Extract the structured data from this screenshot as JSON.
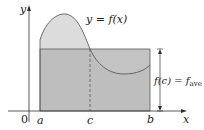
{
  "diagram": {
    "axes": {
      "x_label": "x",
      "y_label": "y",
      "origin_label": "0"
    },
    "curve_label": {
      "lhs": "y = ",
      "fn": "f",
      "arg": "(x)"
    },
    "points": {
      "a": "a",
      "c": "c",
      "b": "b"
    },
    "average_label": {
      "lhs_fn": "f",
      "lhs_arg": "(c) = ",
      "rhs_fn": "f",
      "rhs_sub": "ave"
    },
    "colors": {
      "curve_fill": "#dcdcdc",
      "rect_fill": "#b9b9b9",
      "stroke": "#5a5a5a",
      "axis": "#333333"
    }
  }
}
